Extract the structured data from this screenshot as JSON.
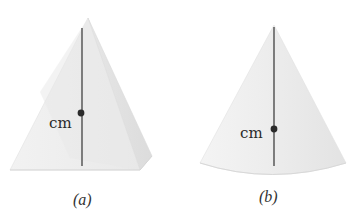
{
  "figures": [
    {
      "id": "a",
      "shape": "pyramid",
      "caption": "(a)",
      "marker_label": "cm"
    },
    {
      "id": "b",
      "shape": "cone",
      "caption": "(b)",
      "marker_label": "cm"
    }
  ],
  "colors": {
    "solid_fill": "#ececec",
    "solid_shade": "#e2e2e2",
    "axis_line": "#333333",
    "marker": "#2b2b2b"
  }
}
